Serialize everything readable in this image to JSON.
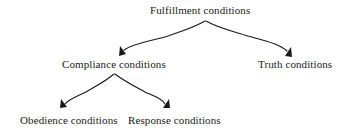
{
  "diagram": {
    "title": "Fulfillment conditions",
    "type": "tree",
    "background_color": "#ffffff",
    "stroke_color": "#1a1a1a",
    "text_color": "#1a1a1a",
    "nodes": [
      {
        "id": "root",
        "label": "Fulfillment conditions",
        "level": 0
      },
      {
        "id": "compliance",
        "label": "Compliance conditions",
        "level": 1
      },
      {
        "id": "truth",
        "label": "Truth conditions",
        "level": 1
      },
      {
        "id": "obedience",
        "label": "Obedience conditions",
        "level": 2
      },
      {
        "id": "response",
        "label": "Response conditions",
        "level": 2
      }
    ],
    "edges": [
      {
        "from": "root",
        "to": "compliance",
        "style": "curved-arrow"
      },
      {
        "from": "root",
        "to": "truth",
        "style": "curved-arrow"
      },
      {
        "from": "compliance",
        "to": "obedience",
        "style": "curved-arrow"
      },
      {
        "from": "compliance",
        "to": "response",
        "style": "curved-arrow"
      }
    ]
  }
}
